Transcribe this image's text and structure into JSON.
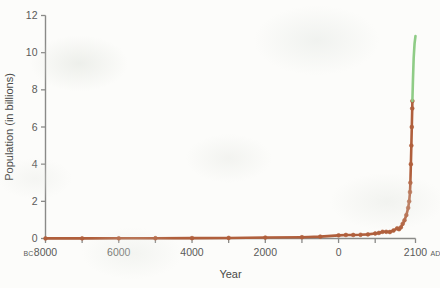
{
  "figure": {
    "background_color": "#fcfcfa",
    "axis_color": "#8a8a88",
    "text_color": "#5a5a58"
  },
  "chart_data": {
    "type": "line",
    "title": "",
    "xlabel": "Year",
    "ylabel": "Population (in billions)",
    "xlim": [
      -8000,
      2100
    ],
    "ylim": [
      0,
      12
    ],
    "grid": false,
    "legend": false,
    "x_tick_labels": [
      "8000",
      "6000",
      "4000",
      "2000",
      "0",
      "2100"
    ],
    "x_tick_values": [
      -8000,
      -6000,
      -4000,
      -2000,
      0,
      2100
    ],
    "x_era_prefix": "BC",
    "x_era_suffix": "AD",
    "y_tick_labels": [
      "0",
      "2",
      "4",
      "6",
      "8",
      "10",
      "12"
    ],
    "y_tick_values": [
      0,
      2,
      4,
      6,
      8,
      10,
      12
    ],
    "series": [
      {
        "name": "Historical population",
        "color": "#b05f3c",
        "marker": "circle",
        "x": [
          -8000,
          -7000,
          -6000,
          -5000,
          -4000,
          -3000,
          -2000,
          -1000,
          -500,
          0,
          200,
          400,
          600,
          800,
          1000,
          1100,
          1200,
          1300,
          1400,
          1500,
          1600,
          1650,
          1700,
          1750,
          1800,
          1850,
          1900,
          1927,
          1950,
          1960,
          1974,
          1987,
          1999,
          2011,
          2015
        ],
        "y": [
          0.005,
          0.007,
          0.01,
          0.015,
          0.02,
          0.03,
          0.05,
          0.07,
          0.1,
          0.17,
          0.19,
          0.19,
          0.2,
          0.22,
          0.27,
          0.3,
          0.36,
          0.36,
          0.35,
          0.43,
          0.55,
          0.5,
          0.6,
          0.79,
          0.98,
          1.26,
          1.65,
          2.0,
          2.5,
          3.0,
          4.0,
          5.0,
          6.0,
          7.0,
          7.4
        ]
      },
      {
        "name": "Projected population",
        "color": "#8fcc86",
        "marker": "none",
        "x": [
          2015,
          2030,
          2050,
          2075,
          2100
        ],
        "y": [
          7.4,
          8.5,
          9.7,
          10.5,
          10.9
        ]
      }
    ]
  }
}
